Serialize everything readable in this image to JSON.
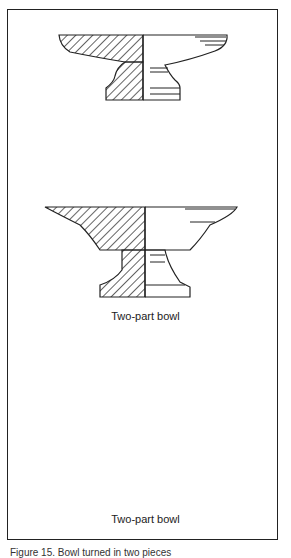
{
  "figure": {
    "bowls": [
      {
        "id": "bowl-1",
        "label": null
      },
      {
        "id": "bowl-2",
        "label": "Two-part bowl"
      },
      {
        "id": "bowl-3",
        "label": "Two-part bowl"
      }
    ],
    "caption": "Figure 15. Bowl turned in two pieces"
  },
  "colors": {
    "line": "#222222",
    "background": "#ffffff"
  }
}
